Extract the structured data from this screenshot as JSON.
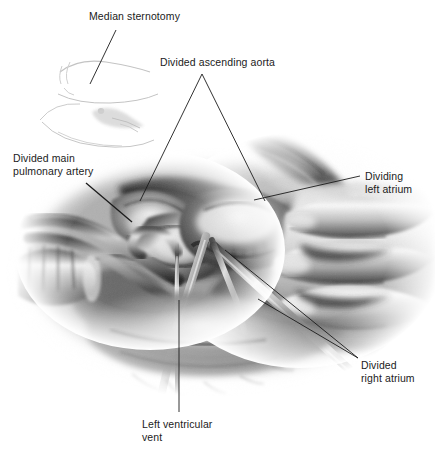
{
  "figure": {
    "medium": "pencil-and-wash grayscale surgical illustration",
    "background_color": "#ffffff",
    "ink_color": "#1b1b1b",
    "leader_line_color": "#1b1b1b",
    "inset": {
      "name": "median-sternotomy-inset",
      "description": "faint light-gray line sketch of a supine patient torso with a vertical midline sternotomy incision",
      "tone": "#cfcfcf"
    },
    "scene": {
      "description": "Open chest operative field showing the divided great vessels, a surgeon's gloved hand retracting tissue from the right, forceps and scissors crossing the field, and a left ventricular vent tube descending at center.",
      "elements": [
        "divided ascending aorta stump",
        "divided main pulmonary artery stump",
        "venous cannula with ribbed collar at left",
        "dividing left atrium cuff",
        "divided right atrium",
        "left ventricular vent catheter",
        "gloved hand with three fingers",
        "surgical forceps",
        "surgical scissors"
      ]
    },
    "labels": [
      {
        "id": "median-sternotomy",
        "text": "Median sternotomy",
        "x": 89,
        "y": 10,
        "leader": {
          "from": [
            116,
            30
          ],
          "to": [
            90,
            84
          ]
        }
      },
      {
        "id": "divided-ascending-aorta",
        "text": "Divided ascending aorta",
        "x": 160,
        "y": 56,
        "leader_apex": [
          202,
          74
        ],
        "leaders": [
          {
            "from": [
              202,
              74
            ],
            "to": [
              140,
              201
            ]
          },
          {
            "from": [
              202,
              74
            ],
            "to": [
              265,
              201
            ]
          }
        ]
      },
      {
        "id": "divided-main-pulmonary-artery",
        "text": "Divided main\npulmonary artery",
        "line1": "Divided main",
        "line2": "pulmonary artery",
        "x": 13,
        "y": 152,
        "leader": {
          "from": [
            86,
            183
          ],
          "to": [
            132,
            222
          ]
        }
      },
      {
        "id": "dividing-left-atrium",
        "text": "Dividing\nleft atrium",
        "line1": "Dividing",
        "line2": "left atrium",
        "x": 365,
        "y": 170,
        "leader": {
          "from": [
            360,
            176
          ],
          "to": [
            254,
            200
          ]
        }
      },
      {
        "id": "divided-right-atrium",
        "text": "Divided\nright atrium",
        "line1": "Divided",
        "line2": "right atrium",
        "x": 361,
        "y": 359,
        "leaders": [
          {
            "from": [
              358,
              358
            ],
            "to": [
              225,
              250
            ]
          },
          {
            "from": [
              358,
              358
            ],
            "to": [
              258,
              299
            ]
          }
        ]
      },
      {
        "id": "left-ventricular-vent",
        "text": "Left ventricular\nvent",
        "line1": "Left ventricular",
        "line2": "vent",
        "x": 142,
        "y": 418,
        "leader": {
          "from": [
            179,
            412
          ],
          "to": [
            179,
            300
          ]
        }
      }
    ]
  }
}
